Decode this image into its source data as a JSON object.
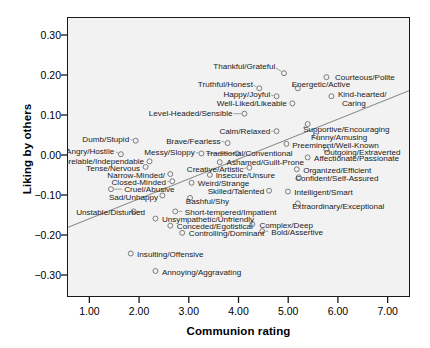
{
  "chart_data": {
    "type": "scatter",
    "title": "",
    "xlabel": "Communion rating",
    "ylabel": "Liking by others",
    "xlim": [
      0.55,
      7.45
    ],
    "ylim": [
      -0.355,
      0.345
    ],
    "xticks": [
      "1.00",
      "2.00",
      "3.00",
      "4.00",
      "5.00",
      "6.00",
      "7.00"
    ],
    "xtick_values": [
      1,
      2,
      3,
      4,
      5,
      6,
      7
    ],
    "yticks": [
      "0.30",
      "0.20",
      "0.10",
      "0.00",
      "-0.10",
      "-0.20",
      "-0.30"
    ],
    "ytick_values": [
      0.3,
      0.2,
      0.1,
      0.0,
      -0.1,
      -0.2,
      -0.3
    ],
    "grid": false,
    "legend": "none",
    "marker": "open-circle",
    "regression_line": {
      "x_start": 0.55,
      "y_start": -0.182,
      "x_end": 7.45,
      "y_end": 0.162
    },
    "points": [
      {
        "label": "Thankful/Grateful",
        "x": 4.92,
        "y": 0.206,
        "lx": 4.72,
        "ly": 0.222,
        "anchor": "end"
      },
      {
        "label": "Courteous/Polite",
        "x": 5.78,
        "y": 0.196,
        "lx": 5.92,
        "ly": 0.196,
        "anchor": "start"
      },
      {
        "label": "Truthful/Honest",
        "x": 4.42,
        "y": 0.168,
        "lx": 4.27,
        "ly": 0.178,
        "anchor": "end"
      },
      {
        "label": "Energetic/Active",
        "x": 5.2,
        "y": 0.168,
        "lx": 5.05,
        "ly": 0.178,
        "anchor": "start"
      },
      {
        "label": "Happy/Joyful",
        "x": 4.77,
        "y": 0.148,
        "lx": 4.62,
        "ly": 0.152,
        "anchor": "end"
      },
      {
        "label": "Kind-hearted/",
        "x": 5.88,
        "y": 0.148,
        "lx": 5.98,
        "ly": 0.152,
        "anchor": "start"
      },
      {
        "label": "Caring",
        "x": null,
        "y": null,
        "lx": 6.06,
        "ly": 0.131,
        "anchor": "start"
      },
      {
        "label": "Well-Liked/Likeable",
        "x": 5.09,
        "y": 0.13,
        "lx": 4.95,
        "ly": 0.13,
        "anchor": "end"
      },
      {
        "label": "Level-Headed/Sensible",
        "x": 4.12,
        "y": 0.104,
        "lx": 3.86,
        "ly": 0.104,
        "anchor": "end"
      },
      {
        "label": "Supportive/Encouraging",
        "x": 5.4,
        "y": 0.078,
        "lx": 5.28,
        "ly": 0.066,
        "anchor": "start"
      },
      {
        "label": "Calm/Relaxed",
        "x": 4.77,
        "y": 0.06,
        "lx": 4.62,
        "ly": 0.06,
        "anchor": "end"
      },
      {
        "label": "Funny/Amusing",
        "x": 5.56,
        "y": 0.048,
        "lx": 5.44,
        "ly": 0.046,
        "anchor": "start"
      },
      {
        "label": "Dumb/Stupid",
        "x": 1.92,
        "y": 0.036,
        "lx": 1.78,
        "ly": 0.04,
        "anchor": "end"
      },
      {
        "label": "Brave/Fearless",
        "x": 3.78,
        "y": 0.03,
        "lx": 3.62,
        "ly": 0.036,
        "anchor": "end"
      },
      {
        "label": "Preeminent/Well-Known",
        "x": 4.97,
        "y": 0.028,
        "lx": 5.06,
        "ly": 0.026,
        "anchor": "start"
      },
      {
        "label": "Outgoing/Extraverted",
        "x": 5.78,
        "y": 0.014,
        "lx": 5.7,
        "ly": 0.008,
        "anchor": "start"
      },
      {
        "label": "Angry/Hostile",
        "x": 1.62,
        "y": 0.002,
        "lx": 1.48,
        "ly": 0.01,
        "anchor": "end"
      },
      {
        "label": "Messy/Sloppy",
        "x": 3.25,
        "y": 0.004,
        "lx": 3.1,
        "ly": 0.007,
        "anchor": "end"
      },
      {
        "label": "Traditional/Conventional",
        "x": 3.97,
        "y": 0.004,
        "lx": 3.32,
        "ly": 0.004,
        "anchor": "start"
      },
      {
        "label": "Affectionate/Passionate",
        "x": 5.4,
        "y": -0.006,
        "lx": 5.5,
        "ly": -0.008,
        "anchor": "start"
      },
      {
        "label": "Unrelable/Independable",
        "x": 2.2,
        "y": -0.016,
        "lx": 2.08,
        "ly": -0.016,
        "anchor": "end"
      },
      {
        "label": "Ashamed/Guilt-Prone",
        "x": 3.62,
        "y": -0.018,
        "lx": 3.74,
        "ly": -0.018,
        "anchor": "start"
      },
      {
        "label": "Tense/Nervous",
        "x": 2.12,
        "y": -0.03,
        "lx": 2.0,
        "ly": -0.032,
        "anchor": "end"
      },
      {
        "label": "Creative/Artistic",
        "x": 4.22,
        "y": -0.032,
        "lx": 4.08,
        "ly": -0.034,
        "anchor": "end"
      },
      {
        "label": "Organized/Efficient",
        "x": 5.18,
        "y": -0.036,
        "lx": 5.28,
        "ly": -0.038,
        "anchor": "start"
      },
      {
        "label": "Narrow-Minded/",
        "x": 2.62,
        "y": -0.048,
        "lx": 2.5,
        "ly": -0.05,
        "anchor": "end"
      },
      {
        "label": "Insecure/Unsure",
        "x": 3.42,
        "y": -0.05,
        "lx": 3.52,
        "ly": -0.05,
        "anchor": "start"
      },
      {
        "label": "Confident/Self-Assured",
        "x": 5.22,
        "y": -0.056,
        "lx": 5.12,
        "ly": -0.058,
        "anchor": "start"
      },
      {
        "label": "Closed-Minded",
        "x": 2.66,
        "y": -0.066,
        "lx": 2.52,
        "ly": -0.068,
        "anchor": "end"
      },
      {
        "label": "Weird/Strange",
        "x": 3.05,
        "y": -0.07,
        "lx": 3.16,
        "ly": -0.07,
        "anchor": "start"
      },
      {
        "label": "Cruel/Abusive",
        "x": 1.42,
        "y": -0.086,
        "lx": 1.68,
        "ly": -0.086,
        "anchor": "start"
      },
      {
        "label": "Skilled/Talented",
        "x": 4.62,
        "y": -0.09,
        "lx": 4.5,
        "ly": -0.09,
        "anchor": "end"
      },
      {
        "label": "Intelligent/Smart",
        "x": 5.0,
        "y": -0.092,
        "lx": 5.1,
        "ly": -0.092,
        "anchor": "start"
      },
      {
        "label": "Sad/Unhappy",
        "x": 2.46,
        "y": -0.102,
        "lx": 2.36,
        "ly": -0.104,
        "anchor": "end"
      },
      {
        "label": "Bashful/Shy",
        "x": 3.02,
        "y": -0.108,
        "lx": 2.92,
        "ly": -0.114,
        "anchor": "start"
      },
      {
        "label": "Extraordinary/Exceptional",
        "x": 5.2,
        "y": -0.122,
        "lx": 5.06,
        "ly": -0.128,
        "anchor": "start"
      },
      {
        "label": "Unstable/Disturbed",
        "x": 1.88,
        "y": -0.142,
        "lx": 2.1,
        "ly": -0.142,
        "anchor": "end"
      },
      {
        "label": "Short-tempered/Impatient",
        "x": 2.72,
        "y": -0.142,
        "lx": 2.9,
        "ly": -0.142,
        "anchor": "start"
      },
      {
        "label": "Unsympathetic/Unfriendly",
        "x": 2.32,
        "y": -0.16,
        "lx": 2.44,
        "ly": -0.16,
        "anchor": "start"
      },
      {
        "label": "Complex/Deep",
        "x": 4.28,
        "y": -0.174,
        "lx": 4.4,
        "ly": -0.174,
        "anchor": "start"
      },
      {
        "label": "Conceded/Egotistical",
        "x": 2.62,
        "y": -0.178,
        "lx": 2.74,
        "ly": -0.178,
        "anchor": "start"
      },
      {
        "label": "Bold/Assertive",
        "x": 4.48,
        "y": -0.192,
        "lx": 4.64,
        "ly": -0.192,
        "anchor": "start"
      },
      {
        "label": "Controlling/Dominant",
        "x": 2.86,
        "y": -0.196,
        "lx": 2.98,
        "ly": -0.196,
        "anchor": "start"
      },
      {
        "label": "Insulting/Offensive",
        "x": 1.82,
        "y": -0.248,
        "lx": 1.94,
        "ly": -0.248,
        "anchor": "start"
      },
      {
        "label": "Annoying/Aggravating",
        "x": 2.32,
        "y": -0.292,
        "lx": 2.44,
        "ly": -0.292,
        "anchor": "start"
      }
    ]
  }
}
